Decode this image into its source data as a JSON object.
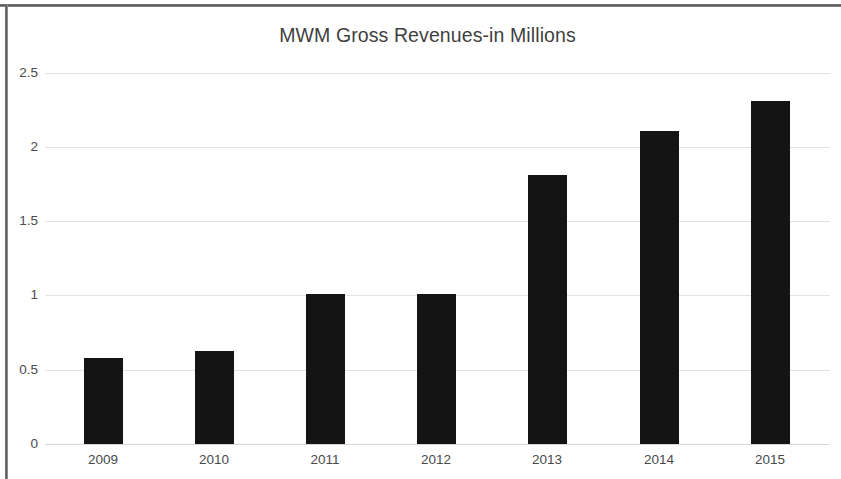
{
  "chart_data": {
    "type": "bar",
    "title": "MWM Gross Revenues-in Millions",
    "xlabel": "",
    "ylabel": "",
    "categories": [
      "2009",
      "2010",
      "2011",
      "2012",
      "2013",
      "2014",
      "2015"
    ],
    "values": [
      0.58,
      0.63,
      1.01,
      1.01,
      1.81,
      2.11,
      2.31
    ],
    "series": [
      {
        "name": "MWM Gross Revenues",
        "values": [
          0.58,
          0.63,
          1.01,
          1.01,
          1.81,
          2.11,
          2.31
        ]
      }
    ],
    "ylim": [
      0,
      2.5
    ],
    "ytick_labels": [
      "2.5",
      "2",
      "1.5",
      "1",
      "0.5",
      "0"
    ],
    "ytick_values": [
      2.5,
      2,
      1.5,
      1,
      0.5,
      0
    ],
    "grid": true,
    "legend": false,
    "legend_position": "none",
    "bar_color": "#141414",
    "gridline_color": "#e3e3e3",
    "text_color": "#4a4a4a",
    "title_color": "#3f3f3f",
    "background_color": "#ffffff"
  }
}
